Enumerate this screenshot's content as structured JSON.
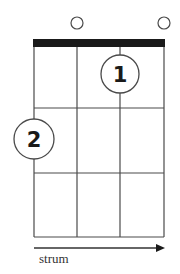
{
  "diagram": {
    "type": "ukulele-chord-chart",
    "colors": {
      "line": "#4a4a4a",
      "nut": "#1a1a1a",
      "text": "#1a1a1a",
      "background": "#ffffff"
    },
    "strings": 4,
    "frets_shown": 3,
    "open_strings": [
      {
        "string": 2,
        "symbol": "open-circle"
      },
      {
        "string": 4,
        "symbol": "open-circle"
      }
    ],
    "fingerings": [
      {
        "finger": "1",
        "string": 3,
        "fret": 1
      },
      {
        "finger": "2",
        "string": 1,
        "fret": 2
      }
    ],
    "strum": {
      "label": "strum",
      "direction": "right"
    }
  }
}
